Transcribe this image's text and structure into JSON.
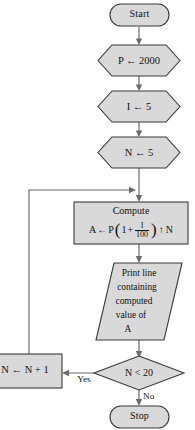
{
  "diagram": {
    "colors": {
      "node_fill": "#d9d9d9",
      "node_stroke": "#3a3a3a",
      "connector": "#6b6b6b",
      "background": "#ffffff",
      "text": "#111111"
    },
    "nodes": {
      "start": {
        "type": "terminal",
        "label": "Start"
      },
      "init_p": {
        "type": "preparation",
        "label": "P ← 2000"
      },
      "init_i": {
        "type": "preparation",
        "label": "I ← 5"
      },
      "init_n": {
        "type": "preparation",
        "label": "N ← 5"
      },
      "compute": {
        "type": "process",
        "title": "Compute",
        "formula": {
          "lhs": "A",
          "assign": "←",
          "principal": "P",
          "open_paren": "(",
          "one": "1",
          "plus": "+",
          "fraction_numerator": "I",
          "fraction_denominator": "100",
          "close_paren": ")",
          "power_operator": "↑",
          "exponent": "N",
          "plain_text": "A ← P(1 + I/100) ↑ N"
        }
      },
      "print": {
        "type": "input-output",
        "lines": [
          "Print line",
          "containing",
          "computed",
          "value of",
          "A"
        ]
      },
      "decision": {
        "type": "decision",
        "label": "N < 20"
      },
      "increment": {
        "type": "process",
        "label": "N ← N + 1"
      },
      "stop": {
        "type": "terminal",
        "label": "Stop"
      }
    },
    "edges": [
      {
        "from": "start",
        "to": "init_p",
        "label": ""
      },
      {
        "from": "init_p",
        "to": "init_i",
        "label": ""
      },
      {
        "from": "init_i",
        "to": "init_n",
        "label": ""
      },
      {
        "from": "init_n",
        "to": "compute",
        "label": ""
      },
      {
        "from": "compute",
        "to": "print",
        "label": ""
      },
      {
        "from": "print",
        "to": "decision",
        "label": ""
      },
      {
        "from": "decision",
        "to": "increment",
        "label": "Yes"
      },
      {
        "from": "decision",
        "to": "stop",
        "label": "No"
      },
      {
        "from": "increment",
        "to": "compute",
        "label": ""
      }
    ],
    "edge_labels": {
      "yes": "Yes",
      "no": "No"
    }
  }
}
